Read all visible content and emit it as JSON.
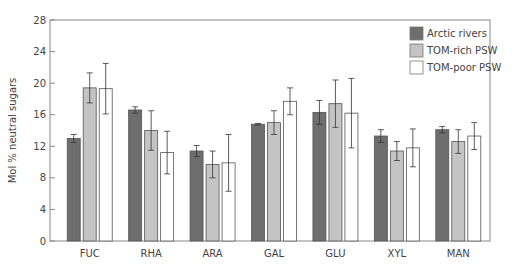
{
  "chart_data": {
    "type": "bar",
    "title": "",
    "xlabel": "",
    "ylabel": "Mol % neutral sugars",
    "ylim": [
      0,
      28
    ],
    "yticks": [
      0,
      4,
      8,
      12,
      16,
      20,
      24,
      28
    ],
    "grid": false,
    "legend_position": "upper right",
    "categories": [
      "FUC",
      "RHA",
      "ARA",
      "GAL",
      "GLU",
      "XYL",
      "MAN"
    ],
    "series": [
      {
        "name": "Arctic rivers",
        "color": "#6e6e6e",
        "values": [
          13.0,
          16.6,
          11.4,
          14.8,
          16.3,
          13.3,
          14.1
        ],
        "errors": [
          0.5,
          0.4,
          0.7,
          0.1,
          1.5,
          0.8,
          0.4
        ]
      },
      {
        "name": "TOM-rich PSW",
        "color": "#c4c4c4",
        "values": [
          19.4,
          14.0,
          9.7,
          15.0,
          17.4,
          11.4,
          12.6
        ],
        "errors": [
          1.9,
          2.5,
          1.7,
          1.5,
          3.0,
          1.2,
          1.5
        ]
      },
      {
        "name": "TOM-poor PSW",
        "color": "#ffffff",
        "values": [
          19.3,
          11.2,
          9.9,
          17.7,
          16.2,
          11.8,
          13.3
        ],
        "errors": [
          3.2,
          2.7,
          3.6,
          1.7,
          4.4,
          2.4,
          1.7
        ]
      }
    ]
  }
}
